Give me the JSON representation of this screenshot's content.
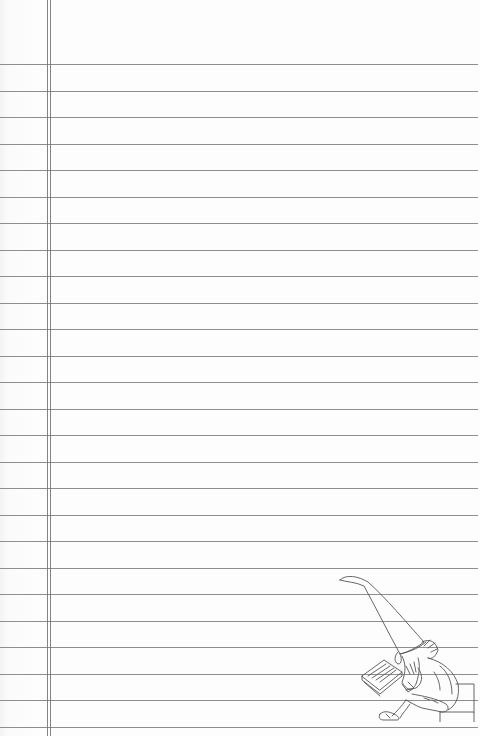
{
  "paper": {
    "type": "ruled-notepaper",
    "background_color": "#fcfcfc",
    "line_color": "#7a7a7a",
    "first_line_y": 64,
    "line_spacing": 26.5,
    "line_count": 26,
    "margin_lines_x": [
      47,
      50
    ]
  },
  "illustration": {
    "subject": "gnome-reading-book-icon",
    "description": "Gnome with tall pointed hat and beard, sitting on a block reading a book"
  }
}
